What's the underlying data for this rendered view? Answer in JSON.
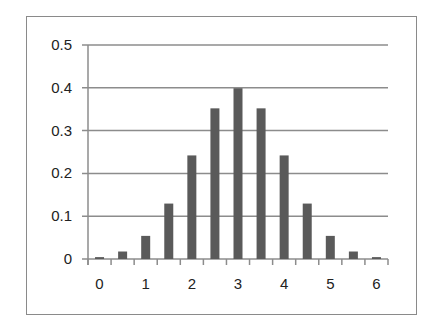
{
  "chart_data": {
    "type": "bar",
    "title": "",
    "xlabel": "",
    "ylabel": "",
    "categories": [
      "0",
      "0.5",
      "1",
      "1.5",
      "2",
      "2.5",
      "3",
      "3.5",
      "4",
      "4.5",
      "5",
      "5.5",
      "6"
    ],
    "values": [
      0.0044,
      0.0175,
      0.054,
      0.1295,
      0.242,
      0.352,
      0.399,
      0.352,
      0.242,
      0.1295,
      0.054,
      0.0175,
      0.0044
    ],
    "ylim": [
      0,
      0.5
    ],
    "yticks": [
      "0",
      "0.1",
      "0.2",
      "0.3",
      "0.4",
      "0.5"
    ],
    "xtick_labels": [
      "0",
      "1",
      "2",
      "3",
      "4",
      "5",
      "6"
    ],
    "grid": true,
    "legend": null,
    "colors": {
      "bar": "#5a5a5a",
      "grid": "#8c8c8c",
      "axis": "#8c8c8c",
      "frame": "#8a8a8a"
    }
  }
}
